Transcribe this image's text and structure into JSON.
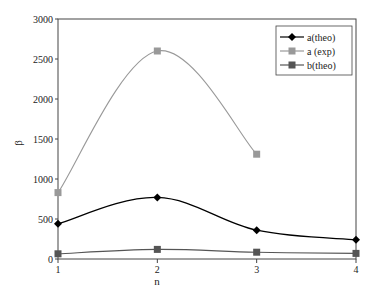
{
  "chart_data": {
    "type": "line",
    "title": "",
    "xlabel": "n",
    "ylabel": "β",
    "x": [
      1,
      2,
      3,
      4
    ],
    "x_ticks": [
      "1",
      "2",
      "3",
      "4"
    ],
    "y_ticks": [
      "0",
      "500",
      "1000",
      "1500",
      "2000",
      "2500",
      "3000"
    ],
    "ylim": [
      0,
      3000
    ],
    "xlim": [
      1,
      4
    ],
    "grid": false,
    "legend_position": "top-right",
    "series": [
      {
        "name": "a(theo)",
        "color": "#000000",
        "marker": "diamond",
        "x": [
          1,
          2,
          3,
          4
        ],
        "values": [
          440,
          770,
          360,
          240
        ]
      },
      {
        "name": "a (exp)",
        "color": "#999999",
        "marker": "square",
        "x": [
          1,
          2,
          3
        ],
        "values": [
          830,
          2600,
          1310
        ]
      },
      {
        "name": "b(theo)",
        "color": "#555555",
        "marker": "square",
        "x": [
          1,
          2,
          3,
          4
        ],
        "values": [
          65,
          120,
          85,
          70
        ]
      }
    ]
  }
}
